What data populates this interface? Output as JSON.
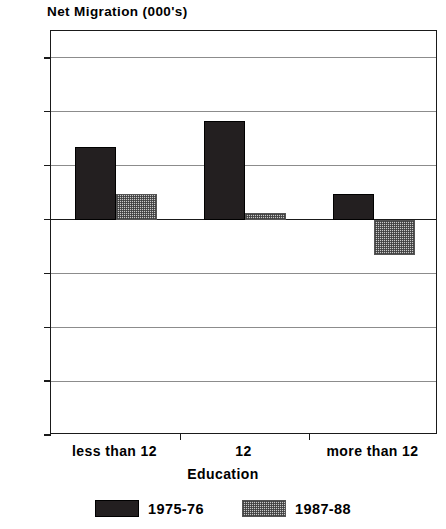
{
  "chart_data": {
    "type": "bar",
    "title": "Net Migration (000's)",
    "ylabel": "Net Migration (000's)",
    "xlabel": "Education",
    "categories": [
      "less than 12",
      "12",
      "more than 12"
    ],
    "series": [
      {
        "name": "1975-76",
        "values": [
          135,
          182,
          48
        ],
        "color": "#231f20",
        "pattern": "solid"
      },
      {
        "name": "1987-88",
        "values": [
          48,
          12,
          -65
        ],
        "color": "#c9c9c9",
        "pattern": "checker"
      }
    ],
    "ylim": [
      -400,
      350
    ],
    "yticks": [
      300,
      200,
      100,
      0,
      -100,
      -200,
      -300,
      -400
    ],
    "ytick_labels": [
      "300",
      "200",
      "100",
      "0",
      "-100",
      "-200",
      "-300",
      "-400"
    ],
    "grid": true,
    "legend_position": "bottom",
    "zero_line": true
  },
  "legend": {
    "items": [
      {
        "label": "1975-76",
        "swatch": "solid-dark-swatch"
      },
      {
        "label": "1987-88",
        "swatch": "checker-gray-swatch"
      }
    ]
  }
}
